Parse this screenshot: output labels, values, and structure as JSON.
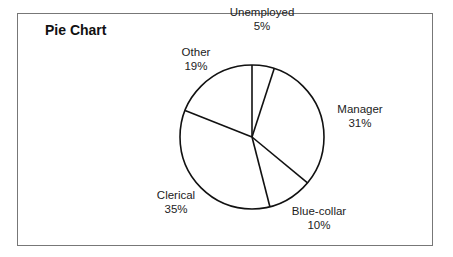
{
  "chart_data": {
    "type": "pie",
    "title": "Pie Chart",
    "categories": [
      "Unemployed",
      "Manager",
      "Blue-collar",
      "Clerical",
      "Other"
    ],
    "values": [
      5,
      31,
      10,
      35,
      19
    ],
    "labels": [
      "5%",
      "31%",
      "10%",
      "35%",
      "19%"
    ],
    "start_angle": "12 o'clock",
    "direction": "clockwise",
    "legend": "none (inline labels outside slices)",
    "fill": "#ffffff",
    "stroke": "#111111"
  },
  "labels": {
    "unemployed": {
      "name": "Unemployed",
      "pct": "5%"
    },
    "manager": {
      "name": "Manager",
      "pct": "31%"
    },
    "bluecollar": {
      "name": "Blue-collar",
      "pct": "10%"
    },
    "clerical": {
      "name": "Clerical",
      "pct": "35%"
    },
    "other": {
      "name": "Other",
      "pct": "19%"
    }
  }
}
